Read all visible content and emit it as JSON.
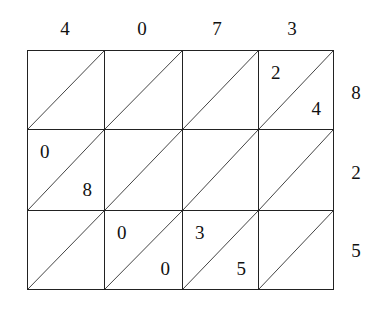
{
  "lattice": {
    "multiplicand_digits": [
      "4",
      "0",
      "7",
      "3"
    ],
    "multiplier_digits": [
      "8",
      "2",
      "5"
    ],
    "cells": [
      [
        {
          "tens": "",
          "ones": ""
        },
        {
          "tens": "",
          "ones": ""
        },
        {
          "tens": "",
          "ones": ""
        },
        {
          "tens": "2",
          "ones": "4"
        }
      ],
      [
        {
          "tens": "0",
          "ones": "8"
        },
        {
          "tens": "",
          "ones": ""
        },
        {
          "tens": "",
          "ones": ""
        },
        {
          "tens": "",
          "ones": ""
        }
      ],
      [
        {
          "tens": "",
          "ones": ""
        },
        {
          "tens": "0",
          "ones": "0"
        },
        {
          "tens": "3",
          "ones": "5"
        },
        {
          "tens": "",
          "ones": ""
        }
      ]
    ]
  }
}
